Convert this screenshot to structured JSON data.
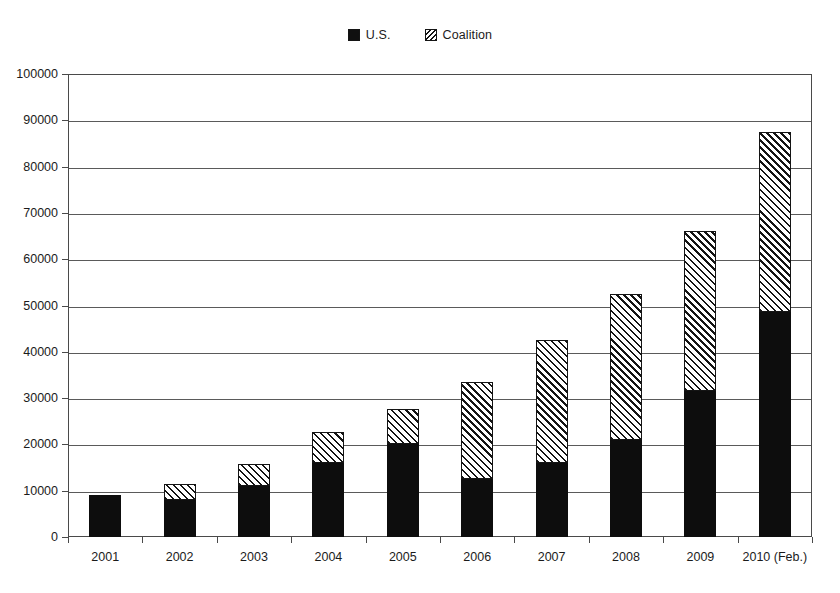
{
  "chart_data": {
    "type": "bar",
    "subtype": "stacked-vertical",
    "title": "",
    "subtitle": "",
    "xlabel": "",
    "ylabel": "",
    "categories": [
      "2001",
      "2002",
      "2003",
      "2004",
      "2005",
      "2006",
      "2007",
      "2008",
      "2009",
      "2010 (Feb.)"
    ],
    "series": [
      {
        "name": "U.S.",
        "pattern": "solid-black",
        "color": "#0d0d0d",
        "values": [
          9000,
          8000,
          11000,
          16000,
          20000,
          12500,
          16000,
          21000,
          31500,
          48500
        ]
      },
      {
        "name": "Coalition",
        "pattern": "diagonal-hatch",
        "color": "#141414",
        "values": [
          0,
          3500,
          4700,
          6700,
          7700,
          21000,
          26500,
          31400,
          34500,
          39000
        ]
      }
    ],
    "totals": [
      9000,
      11500,
      15700,
      22700,
      27700,
      33500,
      42500,
      52400,
      66000,
      87500
    ],
    "ylim": [
      0,
      100000
    ],
    "ytick_values": [
      0,
      10000,
      20000,
      30000,
      40000,
      50000,
      60000,
      70000,
      80000,
      90000,
      100000
    ],
    "ytick_labels": [
      "0",
      "10000",
      "20000",
      "30000",
      "40000",
      "50000",
      "60000",
      "70000",
      "80000",
      "90000",
      "100000"
    ],
    "grid": true,
    "grid_axis": "y",
    "legend_position": "top-center",
    "legend_entries": [
      "U.S.",
      "Coalition"
    ]
  },
  "legend": {
    "entries": [
      {
        "label": "U.S.",
        "swatch": "solid-square-icon"
      },
      {
        "label": "Coalition",
        "swatch": "hatched-square-icon"
      }
    ]
  }
}
